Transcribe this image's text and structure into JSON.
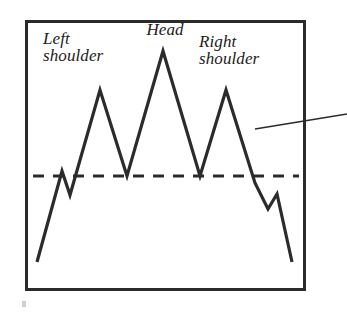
{
  "figure": {
    "name": "head-and-shoulders-pattern",
    "frame": {
      "x": 25,
      "y": 20,
      "width": 281,
      "height": 271,
      "stroke_color": "#2b2b2b",
      "stroke_width": 3,
      "fill_color": "#ffffff"
    },
    "background_color": "#ffffff"
  },
  "annotations": {
    "left_shoulder": {
      "label": "Left\nshoulder",
      "line1": "Left",
      "line2": "shoulder"
    },
    "head": {
      "label": "Head"
    },
    "right_shoulder": {
      "label": "Right\nshoulder",
      "line1": "Right",
      "line2": "shoulder"
    }
  },
  "leader_line": {
    "name": "callout-leader-line",
    "x1": 255,
    "y1": 129,
    "x2": 347,
    "y2": 114,
    "stroke_color": "#2b2b2b",
    "stroke_width": 1.6
  },
  "neckline": {
    "label": "neckline",
    "y": 176,
    "x_start": 33,
    "x_end": 299,
    "stroke_color": "#2b2b2b",
    "stroke_width": 3.2,
    "dash_pattern": "11 9"
  },
  "chart_data": {
    "type": "line",
    "title": "",
    "subtitle": "",
    "xlabel": "",
    "ylabel": "",
    "grid": false,
    "legend_position": "none",
    "xlim": [
      25,
      306
    ],
    "ylim": [
      291,
      20
    ],
    "series": [
      {
        "name": "price",
        "stroke_color": "#2b2b2b",
        "stroke_width": 3.2,
        "x": [
          37,
          62,
          70,
          100,
          127,
          163,
          200,
          226,
          255,
          268,
          277,
          292
        ],
        "y": [
          262,
          171,
          195,
          90,
          176,
          51,
          176,
          90,
          183,
          209,
          194,
          262
        ],
        "points": [
          {
            "x": 37,
            "y": 262,
            "role": "start"
          },
          {
            "x": 62,
            "y": 171,
            "role": "minor-peak"
          },
          {
            "x": 70,
            "y": 195,
            "role": "minor-trough"
          },
          {
            "x": 100,
            "y": 90,
            "role": "left-shoulder-peak"
          },
          {
            "x": 127,
            "y": 176,
            "role": "left-trough-neckline"
          },
          {
            "x": 163,
            "y": 51,
            "role": "head-peak"
          },
          {
            "x": 200,
            "y": 176,
            "role": "right-trough-neckline"
          },
          {
            "x": 226,
            "y": 90,
            "role": "right-shoulder-peak"
          },
          {
            "x": 255,
            "y": 183,
            "role": "neckline-breakdown"
          },
          {
            "x": 268,
            "y": 209,
            "role": "minor-trough"
          },
          {
            "x": 277,
            "y": 194,
            "role": "minor-peak"
          },
          {
            "x": 292,
            "y": 262,
            "role": "end"
          }
        ]
      }
    ],
    "reference_lines": [
      {
        "name": "neckline",
        "orientation": "horizontal",
        "value": 176,
        "style": "dashed"
      }
    ],
    "annotations": [
      {
        "text": "Left shoulder",
        "x": 100,
        "y": 90
      },
      {
        "text": "Head",
        "x": 163,
        "y": 51
      },
      {
        "text": "Right shoulder",
        "x": 226,
        "y": 90
      }
    ]
  },
  "artifacts": {
    "corner_speck": {
      "name": "scan-speck",
      "x": 22,
      "y": 301,
      "width": 4,
      "height": 6,
      "color": "#cfcfcf"
    }
  }
}
